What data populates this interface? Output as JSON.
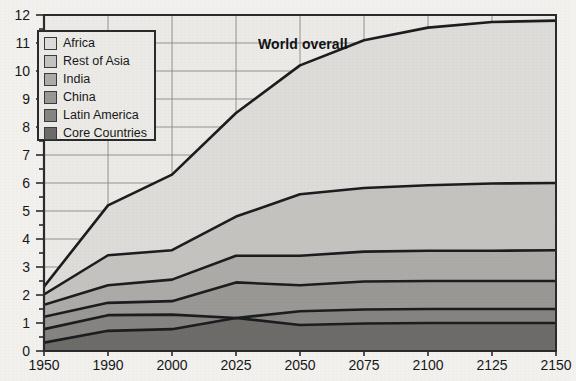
{
  "annotation": {
    "world_overall": "World overall"
  },
  "legend": {
    "items": [
      {
        "label": "Africa",
        "color": "#dedcd8"
      },
      {
        "label": "Rest of Asia",
        "color": "#c5c3bf"
      },
      {
        "label": "India",
        "color": "#adaba7"
      },
      {
        "label": "China",
        "color": "#9a9894"
      },
      {
        "label": "Latin America",
        "color": "#868481"
      },
      {
        "label": "Core Countries",
        "color": "#6e6c69"
      }
    ]
  },
  "chart_data": {
    "type": "area",
    "title": "",
    "subtitle": "",
    "xlabel": "",
    "ylabel": "",
    "annotations": [
      {
        "text": "World overall",
        "x": "2025",
        "y": 10.8
      }
    ],
    "grid": true,
    "legend_position": "top-left",
    "stacked": true,
    "categories": [
      "1950",
      "1990",
      "2000",
      "2025",
      "2050",
      "2075",
      "2100",
      "2125",
      "2150"
    ],
    "xlim": [
      "1950",
      "2150"
    ],
    "ylim": [
      0,
      12
    ],
    "ytick_labels": [
      "0",
      "1",
      "2",
      "3",
      "4",
      "5",
      "6",
      "7",
      "8",
      "9",
      "10",
      "11",
      "12"
    ],
    "yminor_step": 0.5,
    "xtick_labels": [
      "1950",
      "1990",
      "2000",
      "2025",
      "2050",
      "2075",
      "2100",
      "2125",
      "2150"
    ],
    "series": [
      {
        "name": "Core Countries",
        "values": [
          0.3,
          0.72,
          0.78,
          1.18,
          0.93,
          0.98,
          1.0,
          1.0,
          1.0
        ]
      },
      {
        "name": "Latin America",
        "values": [
          0.78,
          1.28,
          1.3,
          1.18,
          1.42,
          1.48,
          1.5,
          1.5,
          1.5
        ]
      },
      {
        "name": "China",
        "values": [
          1.22,
          1.72,
          1.78,
          2.45,
          2.35,
          2.48,
          2.5,
          2.5,
          2.5
        ]
      },
      {
        "name": "India",
        "values": [
          1.65,
          2.35,
          2.55,
          3.4,
          3.4,
          3.55,
          3.58,
          3.58,
          3.6
        ]
      },
      {
        "name": "Rest of Asia",
        "values": [
          2.02,
          3.42,
          3.6,
          4.8,
          5.6,
          5.82,
          5.92,
          5.98,
          6.0
        ]
      },
      {
        "name": "Africa",
        "values": [
          2.3,
          5.2,
          6.3,
          8.5,
          10.2,
          11.1,
          11.55,
          11.75,
          11.8
        ]
      }
    ],
    "series_cumulative_note": "values are cumulative stack tops in billions",
    "colors": [
      "#6e6c69",
      "#868481",
      "#9a9894",
      "#adaba7",
      "#c5c3bf",
      "#dedcd8"
    ]
  },
  "axes": {
    "left_px": 44,
    "right_px": 556,
    "top_px": 15,
    "bottom_px": 351
  }
}
